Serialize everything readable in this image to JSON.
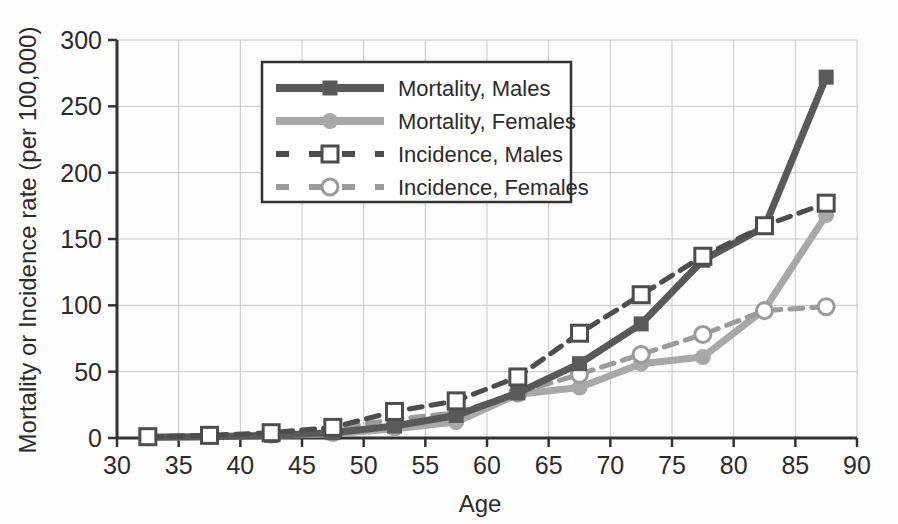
{
  "chart_data": {
    "type": "line",
    "title": "",
    "subtitle": "",
    "xlabel": "Age",
    "ylabel": "Mortality or Incidence rate (per 100,000)",
    "xlim": [
      30,
      90
    ],
    "ylim": [
      0,
      300
    ],
    "xticks": [
      30,
      35,
      40,
      45,
      50,
      55,
      60,
      65,
      70,
      75,
      80,
      85,
      90
    ],
    "yticks": [
      0,
      50,
      100,
      150,
      200,
      250,
      300
    ],
    "grid": true,
    "legend_position": "upper-center",
    "x": [
      32.5,
      37.5,
      42.5,
      47.5,
      52.5,
      57.5,
      62.5,
      67.5,
      72.5,
      77.5,
      82.5,
      87.5
    ],
    "series": [
      {
        "name": "Mortality, Males",
        "color": "#595959",
        "linestyle": "solid",
        "marker": "filled-square",
        "values": [
          0.5,
          1,
          2,
          4,
          9,
          17,
          34,
          56,
          86,
          134,
          159,
          272
        ]
      },
      {
        "name": "Mortality, Females",
        "color": "#a8a8a8",
        "linestyle": "solid",
        "marker": "filled-circle",
        "values": [
          0.5,
          1,
          2,
          3,
          7,
          12,
          33,
          38,
          56,
          61,
          97,
          168
        ]
      },
      {
        "name": "Incidence, Males",
        "color": "#4d4d4d",
        "linestyle": "dashed",
        "marker": "open-square",
        "values": [
          1,
          2,
          4,
          8,
          20,
          28,
          46,
          79,
          108,
          137,
          160,
          177
        ]
      },
      {
        "name": "Incidence, Females",
        "color": "#9b9b9b",
        "linestyle": "dashed",
        "marker": "open-circle",
        "values": [
          1,
          2,
          3,
          7,
          14,
          19,
          34,
          48,
          63,
          78,
          96,
          99
        ]
      }
    ]
  },
  "axes": {
    "x_tick_labels": [
      "30",
      "35",
      "40",
      "45",
      "50",
      "55",
      "60",
      "65",
      "70",
      "75",
      "80",
      "85",
      "90"
    ],
    "y_tick_labels": [
      "0",
      "50",
      "100",
      "150",
      "200",
      "250",
      "300"
    ],
    "x_title": "Age",
    "y_title": "Mortality or Incidence rate (per 100,000)"
  },
  "legend": {
    "items": [
      {
        "label": "Mortality, Males"
      },
      {
        "label": "Mortality, Females"
      },
      {
        "label": "Incidence, Males"
      },
      {
        "label": "Incidence, Females"
      }
    ]
  },
  "colors": {
    "mortality_males": "#595959",
    "mortality_females": "#a8a8a8",
    "incidence_males": "#4d4d4d",
    "incidence_females": "#9b9b9b",
    "axis": "#333333",
    "grid": "#c8c8c8",
    "text": "#2b2b2b",
    "background": "#fdfdfd"
  }
}
